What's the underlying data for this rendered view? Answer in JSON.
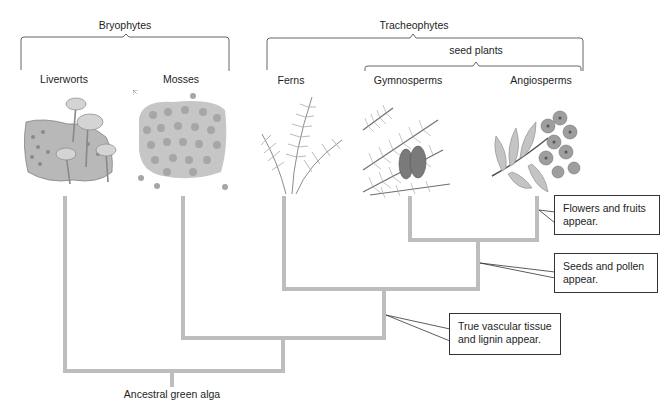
{
  "groups": {
    "bryophytes": "Bryophytes",
    "tracheophytes": "Tracheophytes",
    "seed_plants": "seed plants"
  },
  "taxa": [
    {
      "name": "Liverworts",
      "illustration": "liverwort-illustration"
    },
    {
      "name": "Mosses",
      "illustration": "moss-illustration"
    },
    {
      "name": "Ferns",
      "illustration": "fern-illustration"
    },
    {
      "name": "Gymnosperms",
      "illustration": "gymnosperm-illustration"
    },
    {
      "name": "Angiosperms",
      "illustration": "angiosperm-illustration"
    }
  ],
  "callouts": {
    "flowers": "Flowers and fruits appear.",
    "seeds": "Seeds and pollen appear.",
    "vascular": "True vascular tissue and lignin appear."
  },
  "root": "Ancestral green alga",
  "colors": {
    "tree_line": "#bdbdbd",
    "bracket": "#555555",
    "callout_border": "#333333",
    "text": "#1e1e1e"
  }
}
